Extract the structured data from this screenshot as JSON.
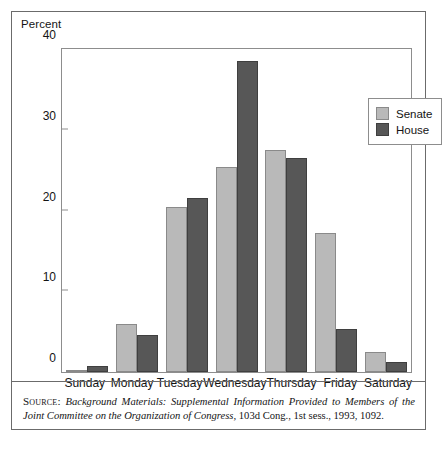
{
  "figure": {
    "axis_title": "Percent",
    "source": {
      "label": "Source:",
      "italic_part": "Background Materials: Supplemental Information Provided to Members of the Joint Committee on the Organization of Congress,",
      "roman_part": "103d Cong., 1st sess., 1993, 1092."
    }
  },
  "legend": {
    "items": [
      {
        "label": "Senate",
        "color": "#b9b9b9"
      },
      {
        "label": "House",
        "color": "#575757"
      }
    ]
  },
  "chart_data": {
    "type": "bar",
    "title": "",
    "xlabel": "",
    "ylabel": "Percent",
    "ylim": [
      0,
      40
    ],
    "yticks": [
      0,
      10,
      20,
      30,
      40
    ],
    "grid": false,
    "legend_position": "top-right",
    "categories": [
      "Sunday",
      "Monday",
      "Tuesday",
      "Wednesday",
      "Thursday",
      "Friday",
      "Saturday"
    ],
    "series": [
      {
        "name": "Senate",
        "color": "#b9b9b9",
        "values": [
          0.2,
          5.9,
          20.4,
          25.4,
          27.5,
          17.2,
          2.5
        ]
      },
      {
        "name": "House",
        "color": "#575757",
        "values": [
          0.7,
          4.6,
          21.6,
          38.5,
          26.5,
          5.3,
          1.2
        ]
      }
    ]
  }
}
